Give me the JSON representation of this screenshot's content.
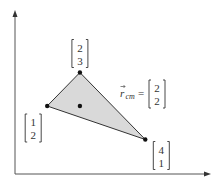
{
  "diagram": {
    "colors": {
      "axis": "#555555",
      "triangle_fill": "#d9d9d9",
      "triangle_stroke": "#333333",
      "point": "#111111",
      "text": "#333333"
    },
    "vertices": [
      {
        "id": "v1",
        "x": 1,
        "y": 2,
        "label_top": "1",
        "label_bottom": "2",
        "label_side": "below-left"
      },
      {
        "id": "v2",
        "x": 2,
        "y": 3,
        "label_top": "2",
        "label_bottom": "3",
        "label_side": "above"
      },
      {
        "id": "v3",
        "x": 4,
        "y": 1,
        "label_top": "4",
        "label_bottom": "1",
        "label_side": "below-right"
      }
    ],
    "center_of_mass": {
      "x": 2,
      "y": 2,
      "symbol": "r",
      "subscript": "cm",
      "equals": "=",
      "label_top": "2",
      "label_bottom": "2"
    }
  }
}
